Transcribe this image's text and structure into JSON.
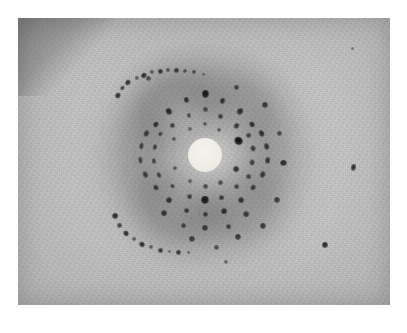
{
  "figure": {
    "kind": "x-ray-diffraction-photograph",
    "width": 407,
    "height": 333,
    "caption": ""
  },
  "colors": {
    "paper_border": "#ffffff",
    "emulsion_base": "#c9c9c9",
    "emulsion_light": "#d6d6d6",
    "halo_dark": "#8a8a8a",
    "spot_dark": "#1b1b1b",
    "beamstop_white": "#f1eee8"
  },
  "plate": {
    "name": "photographic-print",
    "x": 18,
    "y": 18,
    "width": 372,
    "height": 287
  },
  "pattern": {
    "center_x": 205,
    "center_y": 155,
    "beamstop_radius": 17,
    "halo_inner_radius": 34,
    "halo_outer_radius": 96,
    "outer_ring_radius": 108
  },
  "halos": [
    {
      "name": "diffuse-halo-outer",
      "cx": 205,
      "cy": 155,
      "r": 100,
      "opacity": 0.2,
      "blur": 17
    },
    {
      "name": "diffuse-halo-mid",
      "cx": 204,
      "cy": 154,
      "r": 80,
      "opacity": 0.24,
      "blur": 15
    },
    {
      "name": "diffuse-halo-inner",
      "cx": 205,
      "cy": 156,
      "r": 60,
      "opacity": 0.16,
      "blur": 13
    },
    {
      "name": "halo-arc-upper-left",
      "cx": 176,
      "cy": 112,
      "r": 40,
      "opacity": 0.26,
      "blur": 13
    },
    {
      "name": "halo-arc-lower-left",
      "cx": 176,
      "cy": 206,
      "r": 36,
      "opacity": 0.26,
      "blur": 13
    },
    {
      "name": "halo-arc-lower-right",
      "cx": 243,
      "cy": 205,
      "r": 34,
      "opacity": 0.2,
      "blur": 13
    },
    {
      "name": "halo-arc-upper-right",
      "cx": 243,
      "cy": 110,
      "r": 32,
      "opacity": 0.16,
      "blur": 13
    }
  ],
  "spots": [
    {
      "x": 205,
      "y": 94,
      "w": 7,
      "h": 8,
      "rot": 0,
      "dark": 0.95
    },
    {
      "x": 186,
      "y": 100,
      "w": 5,
      "h": 6,
      "rot": -20,
      "dark": 0.8
    },
    {
      "x": 222,
      "y": 101,
      "w": 5,
      "h": 6,
      "rot": 20,
      "dark": 0.78
    },
    {
      "x": 169,
      "y": 111,
      "w": 6,
      "h": 7,
      "rot": -35,
      "dark": 0.85
    },
    {
      "x": 240,
      "y": 111,
      "w": 6,
      "h": 7,
      "rot": 35,
      "dark": 0.8
    },
    {
      "x": 205,
      "y": 109,
      "w": 5,
      "h": 5,
      "rot": 0,
      "dark": 0.62
    },
    {
      "x": 189,
      "y": 115,
      "w": 4,
      "h": 5,
      "rot": -20,
      "dark": 0.62
    },
    {
      "x": 220,
      "y": 116,
      "w": 5,
      "h": 5,
      "rot": 20,
      "dark": 0.7
    },
    {
      "x": 156,
      "y": 124,
      "w": 6,
      "h": 5,
      "rot": -52,
      "dark": 0.8
    },
    {
      "x": 252,
      "y": 124,
      "w": 6,
      "h": 5,
      "rot": 52,
      "dark": 0.82
    },
    {
      "x": 172,
      "y": 125,
      "w": 5,
      "h": 5,
      "rot": -38,
      "dark": 0.7
    },
    {
      "x": 236,
      "y": 126,
      "w": 5,
      "h": 6,
      "rot": 38,
      "dark": 0.74
    },
    {
      "x": 205,
      "y": 124,
      "w": 4,
      "h": 4,
      "rot": 0,
      "dark": 0.52
    },
    {
      "x": 190,
      "y": 129,
      "w": 4,
      "h": 4,
      "rot": -18,
      "dark": 0.55
    },
    {
      "x": 219,
      "y": 130,
      "w": 4,
      "h": 4,
      "rot": 18,
      "dark": 0.58
    },
    {
      "x": 146,
      "y": 133,
      "w": 7,
      "h": 5,
      "rot": -64,
      "dark": 0.72
    },
    {
      "x": 261,
      "y": 133,
      "w": 7,
      "h": 5,
      "rot": 64,
      "dark": 0.8
    },
    {
      "x": 160,
      "y": 134,
      "w": 5,
      "h": 4,
      "rot": -56,
      "dark": 0.64
    },
    {
      "x": 248,
      "y": 135,
      "w": 5,
      "h": 5,
      "rot": 56,
      "dark": 0.68
    },
    {
      "x": 238,
      "y": 141,
      "w": 9,
      "h": 8,
      "rot": 40,
      "dark": 1.0
    },
    {
      "x": 174,
      "y": 139,
      "w": 4,
      "h": 4,
      "rot": -40,
      "dark": 0.58
    },
    {
      "x": 141,
      "y": 146,
      "w": 7,
      "h": 4,
      "rot": -78,
      "dark": 0.68
    },
    {
      "x": 266,
      "y": 146,
      "w": 7,
      "h": 5,
      "rot": 78,
      "dark": 0.76
    },
    {
      "x": 155,
      "y": 147,
      "w": 6,
      "h": 4,
      "rot": -76,
      "dark": 0.66
    },
    {
      "x": 253,
      "y": 148,
      "w": 6,
      "h": 5,
      "rot": 76,
      "dark": 0.72
    },
    {
      "x": 140,
      "y": 160,
      "w": 7,
      "h": 4,
      "rot": -96,
      "dark": 0.66
    },
    {
      "x": 267,
      "y": 160,
      "w": 7,
      "h": 5,
      "rot": 96,
      "dark": 0.74
    },
    {
      "x": 154,
      "y": 161,
      "w": 6,
      "h": 4,
      "rot": -98,
      "dark": 0.64
    },
    {
      "x": 252,
      "y": 162,
      "w": 6,
      "h": 5,
      "rot": 98,
      "dark": 0.7
    },
    {
      "x": 175,
      "y": 168,
      "w": 4,
      "h": 4,
      "rot": -140,
      "dark": 0.58
    },
    {
      "x": 236,
      "y": 169,
      "w": 6,
      "h": 6,
      "rot": 140,
      "dark": 0.8
    },
    {
      "x": 145,
      "y": 174,
      "w": 7,
      "h": 5,
      "rot": -114,
      "dark": 0.7
    },
    {
      "x": 262,
      "y": 174,
      "w": 7,
      "h": 5,
      "rot": 114,
      "dark": 0.74
    },
    {
      "x": 159,
      "y": 175,
      "w": 6,
      "h": 4,
      "rot": -116,
      "dark": 0.68
    },
    {
      "x": 248,
      "y": 176,
      "w": 5,
      "h": 5,
      "rot": 116,
      "dark": 0.66
    },
    {
      "x": 190,
      "y": 181,
      "w": 4,
      "h": 4,
      "rot": 160,
      "dark": 0.55
    },
    {
      "x": 220,
      "y": 182,
      "w": 5,
      "h": 5,
      "rot": -160,
      "dark": 0.62
    },
    {
      "x": 205,
      "y": 186,
      "w": 5,
      "h": 5,
      "rot": 0,
      "dark": 0.6
    },
    {
      "x": 156,
      "y": 187,
      "w": 6,
      "h": 5,
      "rot": -128,
      "dark": 0.72
    },
    {
      "x": 253,
      "y": 187,
      "w": 6,
      "h": 5,
      "rot": 128,
      "dark": 0.7
    },
    {
      "x": 172,
      "y": 186,
      "w": 5,
      "h": 4,
      "rot": -140,
      "dark": 0.64
    },
    {
      "x": 236,
      "y": 186,
      "w": 5,
      "h": 5,
      "rot": 140,
      "dark": 0.66
    },
    {
      "x": 189,
      "y": 196,
      "w": 5,
      "h": 5,
      "rot": 168,
      "dark": 0.7
    },
    {
      "x": 221,
      "y": 197,
      "w": 5,
      "h": 5,
      "rot": -168,
      "dark": 0.72
    },
    {
      "x": 205,
      "y": 200,
      "w": 8,
      "h": 8,
      "rot": 0,
      "dark": 0.95
    },
    {
      "x": 169,
      "y": 200,
      "w": 6,
      "h": 6,
      "rot": -150,
      "dark": 0.78
    },
    {
      "x": 241,
      "y": 200,
      "w": 6,
      "h": 6,
      "rot": 150,
      "dark": 0.76
    },
    {
      "x": 186,
      "y": 210,
      "w": 5,
      "h": 5,
      "rot": 172,
      "dark": 0.72
    },
    {
      "x": 224,
      "y": 211,
      "w": 6,
      "h": 6,
      "rot": -172,
      "dark": 0.8
    },
    {
      "x": 205,
      "y": 214,
      "w": 5,
      "h": 5,
      "rot": 0,
      "dark": 0.66
    },
    {
      "x": 164,
      "y": 213,
      "w": 6,
      "h": 6,
      "rot": -152,
      "dark": 0.78
    },
    {
      "x": 246,
      "y": 214,
      "w": 6,
      "h": 6,
      "rot": 152,
      "dark": 0.74
    },
    {
      "x": 205,
      "y": 228,
      "w": 6,
      "h": 6,
      "rot": 0,
      "dark": 0.72
    },
    {
      "x": 183,
      "y": 225,
      "w": 5,
      "h": 5,
      "rot": 176,
      "dark": 0.66
    },
    {
      "x": 228,
      "y": 226,
      "w": 5,
      "h": 5,
      "rot": -176,
      "dark": 0.68
    },
    {
      "x": 192,
      "y": 239,
      "w": 6,
      "h": 6,
      "rot": 0,
      "dark": 0.7
    },
    {
      "x": 238,
      "y": 237,
      "w": 6,
      "h": 6,
      "rot": 0,
      "dark": 0.72
    },
    {
      "x": 216,
      "y": 247,
      "w": 5,
      "h": 5,
      "rot": 0,
      "dark": 0.6
    },
    {
      "x": 263,
      "y": 226,
      "w": 6,
      "h": 6,
      "rot": 0,
      "dark": 0.72
    },
    {
      "x": 277,
      "y": 200,
      "w": 6,
      "h": 6,
      "rot": 0,
      "dark": 0.7
    },
    {
      "x": 283,
      "y": 163,
      "w": 7,
      "h": 6,
      "rot": 0,
      "dark": 0.8
    },
    {
      "x": 279,
      "y": 133,
      "w": 5,
      "h": 5,
      "rot": 0,
      "dark": 0.62
    },
    {
      "x": 265,
      "y": 105,
      "w": 6,
      "h": 6,
      "rot": 0,
      "dark": 0.72
    },
    {
      "x": 236,
      "y": 87,
      "w": 5,
      "h": 5,
      "rot": 0,
      "dark": 0.66
    },
    {
      "x": 226,
      "y": 262,
      "w": 4,
      "h": 4,
      "rot": 0,
      "dark": 0.5
    },
    {
      "x": 325,
      "y": 245,
      "w": 6,
      "h": 6,
      "rot": 0,
      "dark": 0.82
    },
    {
      "x": 353,
      "y": 167,
      "w": 5,
      "h": 7,
      "rot": 10,
      "dark": 0.8
    },
    {
      "x": 352,
      "y": 48,
      "w": 3,
      "h": 3,
      "rot": 0,
      "dark": 0.45
    },
    {
      "x": 148,
      "y": 78,
      "w": 5,
      "h": 5,
      "rot": 0,
      "dark": 0.6
    }
  ],
  "arc_upper_left": {
    "name": "outer-debye-arc-upper-left",
    "spots": [
      {
        "x": 118,
        "y": 95,
        "w": 6,
        "h": 5,
        "rot": -60,
        "dark": 0.82
      },
      {
        "x": 122,
        "y": 88,
        "w": 5,
        "h": 4,
        "rot": -55,
        "dark": 0.7
      },
      {
        "x": 128,
        "y": 82,
        "w": 6,
        "h": 5,
        "rot": -48,
        "dark": 0.8
      },
      {
        "x": 137,
        "y": 78,
        "w": 4,
        "h": 4,
        "rot": -42,
        "dark": 0.6
      },
      {
        "x": 144,
        "y": 75,
        "w": 6,
        "h": 5,
        "rot": -35,
        "dark": 0.82
      },
      {
        "x": 152,
        "y": 72,
        "w": 4,
        "h": 4,
        "rot": -28,
        "dark": 0.6
      },
      {
        "x": 160,
        "y": 71,
        "w": 5,
        "h": 5,
        "rot": -20,
        "dark": 0.78
      },
      {
        "x": 168,
        "y": 70,
        "w": 4,
        "h": 4,
        "rot": -14,
        "dark": 0.6
      },
      {
        "x": 176,
        "y": 70,
        "w": 5,
        "h": 5,
        "rot": -8,
        "dark": 0.74
      },
      {
        "x": 185,
        "y": 71,
        "w": 4,
        "h": 4,
        "rot": 0,
        "dark": 0.55
      },
      {
        "x": 194,
        "y": 72,
        "w": 4,
        "h": 4,
        "rot": 6,
        "dark": 0.6
      },
      {
        "x": 203,
        "y": 74,
        "w": 3,
        "h": 3,
        "rot": 10,
        "dark": 0.45
      }
    ]
  },
  "arc_lower_left": {
    "name": "outer-debye-arc-lower-left",
    "spots": [
      {
        "x": 115,
        "y": 216,
        "w": 6,
        "h": 6,
        "rot": 60,
        "dark": 0.85
      },
      {
        "x": 119,
        "y": 225,
        "w": 5,
        "h": 5,
        "rot": 56,
        "dark": 0.7
      },
      {
        "x": 126,
        "y": 233,
        "w": 6,
        "h": 5,
        "rot": 48,
        "dark": 0.82
      },
      {
        "x": 134,
        "y": 239,
        "w": 4,
        "h": 4,
        "rot": 42,
        "dark": 0.6
      },
      {
        "x": 142,
        "y": 244,
        "w": 6,
        "h": 5,
        "rot": 35,
        "dark": 0.82
      },
      {
        "x": 151,
        "y": 247,
        "w": 4,
        "h": 4,
        "rot": 28,
        "dark": 0.58
      },
      {
        "x": 160,
        "y": 250,
        "w": 5,
        "h": 5,
        "rot": 20,
        "dark": 0.76
      },
      {
        "x": 169,
        "y": 251,
        "w": 3,
        "h": 3,
        "rot": 14,
        "dark": 0.5
      },
      {
        "x": 178,
        "y": 252,
        "w": 5,
        "h": 5,
        "rot": 8,
        "dark": 0.74
      },
      {
        "x": 188,
        "y": 252,
        "w": 3,
        "h": 3,
        "rot": 2,
        "dark": 0.48
      }
    ]
  }
}
